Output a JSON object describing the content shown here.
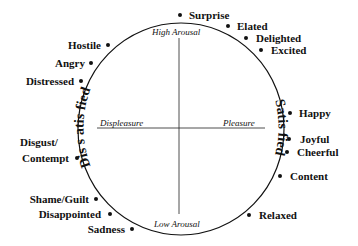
{
  "diagram": {
    "axes": {
      "top": "High Arousal",
      "bottom": "Low Arousal",
      "left": "Displeasure",
      "right": "Pleasure"
    },
    "regions": {
      "left": "Dis s atis fied",
      "right": "Satis fied"
    },
    "emotions": [
      {
        "label": "Surprise",
        "side": "right"
      },
      {
        "label": "Elated",
        "side": "right"
      },
      {
        "label": "Delighted",
        "side": "right"
      },
      {
        "label": "Excited",
        "side": "right"
      },
      {
        "label": "Happy",
        "side": "right"
      },
      {
        "label": "Joyful",
        "side": "right"
      },
      {
        "label": "Cheerful",
        "side": "right"
      },
      {
        "label": "Content",
        "side": "right"
      },
      {
        "label": "Relaxed",
        "side": "right"
      },
      {
        "label": "Hostile",
        "side": "left"
      },
      {
        "label": "Angry",
        "side": "left"
      },
      {
        "label": "Distressed",
        "side": "left"
      },
      {
        "label": "Disgust/",
        "side": "left"
      },
      {
        "label": "Contempt",
        "side": "left"
      },
      {
        "label": "Shame/Guilt",
        "side": "left"
      },
      {
        "label": "Disappointed",
        "side": "left"
      },
      {
        "label": "Sadness",
        "side": "left"
      }
    ]
  }
}
